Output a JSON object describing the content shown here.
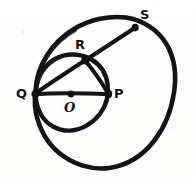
{
  "figure": {
    "style": "hand-drawn marker sketch on white paper",
    "background_color": "#fdfdfc",
    "ink_color": "#141414",
    "width": 193,
    "height": 178,
    "points": [
      {
        "id": "Q",
        "label": "Q",
        "x": 35,
        "y": 94,
        "label_x": 16,
        "label_y": 87,
        "marked_dot": false
      },
      {
        "id": "P",
        "label": "P",
        "x": 108,
        "y": 94,
        "label_x": 114,
        "label_y": 87,
        "marked_dot": false
      },
      {
        "id": "O",
        "label": "O",
        "x": 71,
        "y": 94,
        "label_x": 64,
        "label_y": 101,
        "marked_dot": true
      },
      {
        "id": "R",
        "label": "R",
        "x": 85,
        "y": 60,
        "label_x": 75,
        "label_y": 38,
        "marked_dot": false
      },
      {
        "id": "S",
        "label": "S",
        "x": 135,
        "y": 27,
        "label_x": 140,
        "label_y": 8,
        "marked_dot": false
      }
    ],
    "circles": [
      {
        "id": "large-circle",
        "center_x": 105,
        "center_y": 93,
        "radius": 70,
        "passes_through": [
          "Q",
          "S"
        ]
      },
      {
        "id": "small-circle",
        "center_x": 71,
        "center_y": 94,
        "radius": 36,
        "passes_through": [
          "Q",
          "P",
          "R"
        ]
      }
    ],
    "segments": [
      {
        "id": "QP",
        "from": "Q",
        "to": "P",
        "description": "diameter of small circle through centre O"
      },
      {
        "id": "QS",
        "from": "Q",
        "to": "S",
        "description": "chord of large circle cutting small circle at R"
      },
      {
        "id": "RP",
        "from": "R",
        "to": "P",
        "description": "chord of small circle"
      }
    ]
  }
}
